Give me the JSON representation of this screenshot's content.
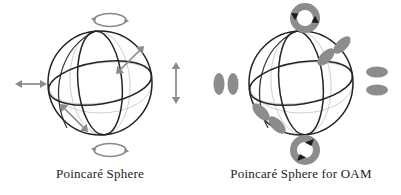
{
  "figure": {
    "background_color": "#ffffff",
    "stroke_color": "#1a1a1a",
    "light_stroke_color": "#c9c9c9",
    "accent_gray": "#8a8a8a",
    "lobe_fill": "#8c8c8c"
  },
  "panels": [
    {
      "id": "poincare-sphere",
      "caption": "Poincaré Sphere",
      "sphere": {
        "center_x": 100,
        "center_y": 83,
        "radius": 52
      },
      "markers": [
        {
          "name": "top-circular-arrow",
          "label": "circular polarization (left-handed)",
          "position": "north-pole",
          "glyph": "loop-arrow"
        },
        {
          "name": "bottom-circular-arrow",
          "label": "circular polarization (right-handed)",
          "position": "south-pole",
          "glyph": "loop-arrow"
        },
        {
          "name": "left-horizontal-arrow",
          "label": "horizontal linear polarization",
          "position": "west",
          "glyph": "double-arrow-horizontal"
        },
        {
          "name": "right-vertical-arrow",
          "label": "vertical linear polarization",
          "position": "east",
          "glyph": "double-arrow-vertical"
        },
        {
          "name": "upper-right-diagonal-arrow",
          "label": "+45 diagonal polarization",
          "position": "upper-right",
          "glyph": "double-arrow-diagonal"
        },
        {
          "name": "lower-left-diagonal-arrow",
          "label": "-45 diagonal polarization",
          "position": "lower-left",
          "glyph": "double-arrow-diagonal"
        }
      ]
    },
    {
      "id": "poincare-sphere-for-oam",
      "caption": "Poincaré Sphere for OAM",
      "sphere": {
        "center_x": 100,
        "center_y": 83,
        "radius": 52
      },
      "markers": [
        {
          "name": "top-ring-mode",
          "label": "OAM ring mode, +l",
          "position": "north-pole",
          "glyph": "annulus-with-arrows"
        },
        {
          "name": "bottom-ring-mode",
          "label": "OAM ring mode, -l",
          "position": "south-pole",
          "glyph": "annulus-with-arrows"
        },
        {
          "name": "left-lobe-pair",
          "label": "two vertical lobes",
          "position": "west",
          "glyph": "lobe-pair-vertical"
        },
        {
          "name": "right-lobe-pair",
          "label": "two horizontal lobes",
          "position": "east",
          "glyph": "lobe-pair-horizontal"
        },
        {
          "name": "upper-right-lobe-pair",
          "label": "two diagonal lobes",
          "position": "upper-right",
          "glyph": "lobe-pair-diagonal"
        },
        {
          "name": "lower-left-lobe-pair",
          "label": "two diagonal lobes",
          "position": "lower-left",
          "glyph": "lobe-pair-diagonal"
        }
      ]
    }
  ]
}
